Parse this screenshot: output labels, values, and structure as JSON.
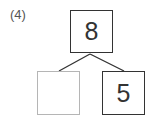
{
  "problem": {
    "label": "(4)",
    "top_value": "8",
    "left_value": "",
    "right_value": "5"
  },
  "colors": {
    "box_border": "#333333",
    "empty_box_border": "#b5b5b5",
    "line": "#333333"
  }
}
